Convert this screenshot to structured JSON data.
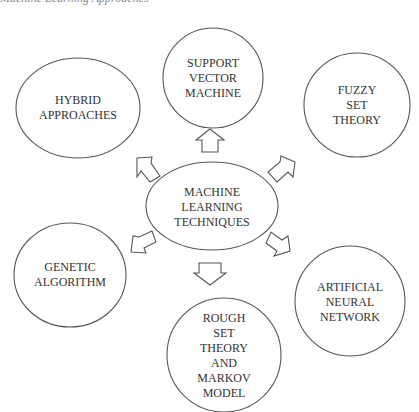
{
  "caption": {
    "text": "Machine Learning Approaches"
  },
  "center": {
    "label": "MACHINE\nLEARNING\nTECHNIQUES"
  },
  "nodes": [
    {
      "id": "svm",
      "label": "SUPPORT\nVECTOR\nMACHINE"
    },
    {
      "id": "fuzzy",
      "label": "FUZZY SET\nTHEORY"
    },
    {
      "id": "ann",
      "label": "ARTIFICIAL\nNEURAL\nNETWORK"
    },
    {
      "id": "rough",
      "label": "ROUGH\nSET\nTHEORY\nAND\nMARKOV\nMODEL"
    },
    {
      "id": "genetic",
      "label": "GENETIC\nALGORITHM"
    },
    {
      "id": "hybrid",
      "label": "HYBRID\nAPPROACHES"
    }
  ],
  "colors": {
    "stroke": "#555555",
    "text": "#333333",
    "background": "#ffffff"
  }
}
